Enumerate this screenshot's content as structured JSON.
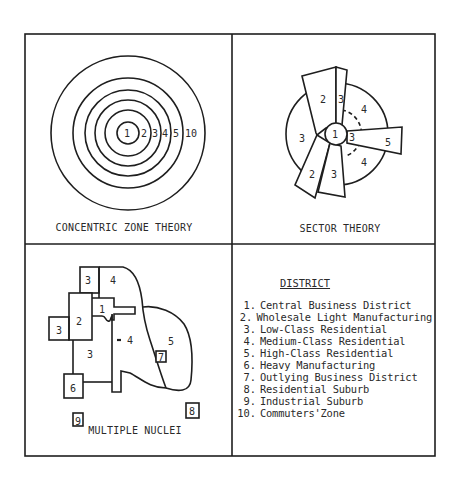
{
  "panels": {
    "concentric": {
      "caption": "CONCENTRIC ZONE THEORY",
      "rings": [
        {
          "zone": "1",
          "radius": 11
        },
        {
          "zone": "2",
          "radius": 23
        },
        {
          "zone": "3",
          "radius": 33
        },
        {
          "zone": "4",
          "radius": 43
        },
        {
          "zone": "5",
          "radius": 55
        },
        {
          "zone": "10",
          "radius": 77
        }
      ],
      "labels": [
        "1",
        "2",
        "3",
        "4",
        "5",
        "10"
      ]
    },
    "sector": {
      "caption": "SECTOR THEORY",
      "labels": {
        "center": "1",
        "upper_wedge_2": "2",
        "narrow_strip_3": "3",
        "upper_right_4": "4",
        "left_3": "3",
        "inner_3": "3",
        "right_wedge_5": "5",
        "lower_right_4": "4",
        "lower_left_2": "2",
        "lower_3": "3"
      }
    },
    "multiple_nuclei": {
      "caption": "MULTIPLE NUCLEI",
      "labels": {
        "top_3": "3",
        "top_4": "4",
        "cbd_1": "1",
        "wholesale_2": "2",
        "left_3": "3",
        "center_3": "3",
        "inner_4": "4",
        "high_class_5": "5",
        "outlying_7": "7",
        "heavy_6": "6",
        "industrial_9": "9",
        "residential_8": "8"
      }
    },
    "legend": {
      "title": "DISTRICT",
      "items": [
        {
          "num": "1.",
          "label": "Central Business District"
        },
        {
          "num": "2.",
          "label": "Wholesale Light Manufacturing"
        },
        {
          "num": "3.",
          "label": "Low-Class Residential"
        },
        {
          "num": "4.",
          "label": "Medium-Class Residential"
        },
        {
          "num": "5.",
          "label": "High-Class Residential"
        },
        {
          "num": "6.",
          "label": "Heavy Manufacturing"
        },
        {
          "num": "7.",
          "label": "Outlying Business District"
        },
        {
          "num": "8.",
          "label": "Residential Suburb"
        },
        {
          "num": "9.",
          "label": "Industrial Suburb"
        },
        {
          "num": "10.",
          "label": "Commuters'Zone"
        }
      ]
    }
  },
  "colors": {
    "line": "#1e1e1e",
    "text": "#2a2a2a",
    "background": "#ffffff"
  }
}
